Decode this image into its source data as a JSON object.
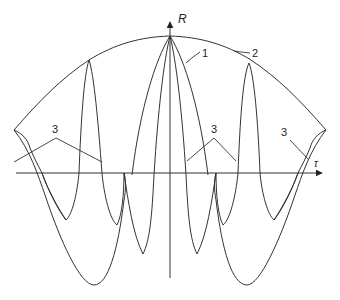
{
  "figure": {
    "stroke_color": "#333333",
    "background": "#ffffff",
    "axes": {
      "y_label": "R",
      "x_label": "τ",
      "origin": [
        170,
        173
      ],
      "y_axis": {
        "from": [
          170,
          278
        ],
        "to": [
          170,
          22
        ]
      },
      "x_axis": {
        "from": [
          16,
          173
        ],
        "to": [
          322,
          173
        ]
      }
    },
    "curve_labels": [
      {
        "id": "1",
        "text": "1",
        "x": 203,
        "y": 56,
        "leader": [
          [
            203,
            52
          ],
          [
            190,
            58
          ],
          [
            185,
            62
          ]
        ]
      },
      {
        "id": "2",
        "text": "2",
        "x": 252,
        "y": 56,
        "leader": [
          [
            250,
            52
          ],
          [
            240,
            52
          ],
          [
            233,
            52
          ]
        ]
      },
      {
        "id": "3a",
        "text": "3",
        "x": 52,
        "y": 134,
        "leader": [
          [
            14,
            160
          ],
          [
            56,
            138
          ],
          [
            102,
            162
          ]
        ]
      },
      {
        "id": "3b",
        "text": "3",
        "x": 211,
        "y": 134,
        "leader": [
          [
            187,
            162
          ],
          [
            214,
            138
          ],
          [
            236,
            162
          ]
        ]
      },
      {
        "id": "3c",
        "text": "3",
        "x": 281,
        "y": 134,
        "leader": [
          [
            290,
            140
          ],
          [
            308,
            160
          ]
        ]
      }
    ],
    "paths": {
      "envelope_2": "M14,130 C40,100 62,78 89,60 C115,44 140,37 170,36 C200,37 225,44 251,60 C278,78 300,100 326,130 C318,133 312,140 310,148 M14,130 C22,133 28,140 30,148",
      "main_peak_1": "M132,175 C140,110 155,60 170,36 C185,60 200,110 208,175",
      "inner_lobes": "M154,175 C158,110 164,60 170,36 C176,60 182,110 186,175 M124,173 C128,200 133,235 143,254 C150,240 152,215 154,175 M216,173 C212,200 207,235 197,254 C190,240 188,215 186,175",
      "side_peaks": "M79,173 C81,120 84,75 89,60 C94,75 98,120 102,173 M238,173 C240,120 243,75 249,63 C254,75 258,120 260,173",
      "side_valleys": "M102,173 C104,195 110,220 117,225 C122,215 124,195 124,173 M238,173 C236,195 230,220 223,225 C218,215 216,195 216,173 M79,173 C77,195 72,215 66,220 C58,210 48,190 42,173 M260,173 C262,195 268,215 274,220 C282,210 292,190 298,173",
      "big_outer": "M14,130 C30,150 38,175 45,195 C60,240 80,285 94,285 C108,285 118,250 124,200 C126,190 126,180 124,173 M326,130 C310,150 302,175 295,195 C280,240 260,285 247,285 C232,285 222,250 216,200 C214,190 214,180 216,173",
      "wiggle_left": "M30,148 C34,158 38,165 42,173 C46,185 56,205 66,220",
      "wiggle_right": "M310,148 C306,158 302,165 298,173 C294,185 284,205 274,220"
    }
  }
}
